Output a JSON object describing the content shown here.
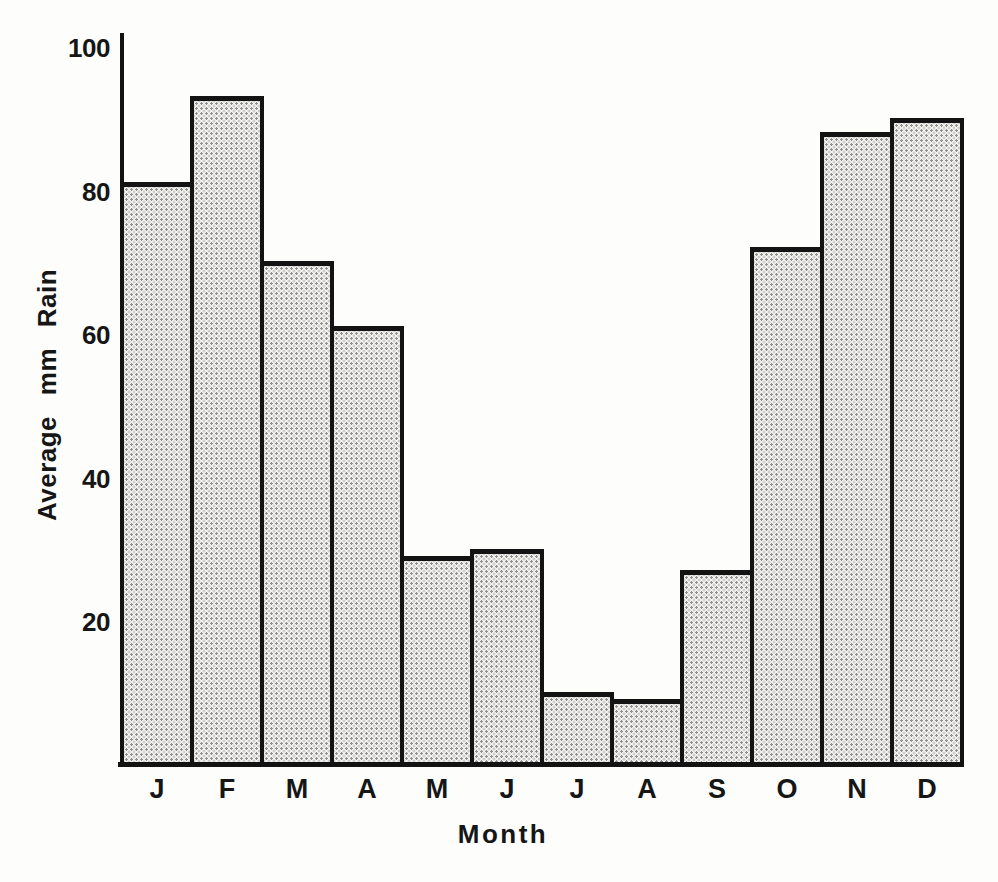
{
  "figure": {
    "paper_color": "#fdfdfc",
    "ink_color": "#131313",
    "bar_fill_base": "#f7f6f3",
    "bar_fill_dot": "#8f8f8f",
    "bar_fill_style": "halftone-stipple"
  },
  "chart_data": {
    "type": "bar",
    "title": "",
    "xlabel": "Month",
    "ylabel": "Average mm Rain",
    "categories": [
      "J",
      "F",
      "M",
      "A",
      "M",
      "J",
      "J",
      "A",
      "S",
      "O",
      "N",
      "D"
    ],
    "values": [
      81,
      93,
      70,
      61,
      29,
      30,
      10,
      9,
      27,
      72,
      88,
      90
    ],
    "yticks": [
      20,
      40,
      60,
      80,
      100
    ],
    "ylim": [
      0,
      100
    ],
    "grid": false,
    "legend": false
  }
}
